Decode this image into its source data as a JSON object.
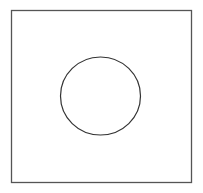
{
  "diagram": {
    "shapes": [
      {
        "type": "square",
        "x": 11.5,
        "y": 10.5,
        "width": 180,
        "height": 172,
        "stroke": "#555555"
      },
      {
        "type": "circle",
        "cx": 100.5,
        "cy": 96,
        "rx": 40,
        "ry": 39,
        "stroke": "#333333"
      }
    ],
    "colors": {
      "background": "#ffffff",
      "square_stroke": "#555555",
      "circle_stroke": "#333333"
    }
  }
}
